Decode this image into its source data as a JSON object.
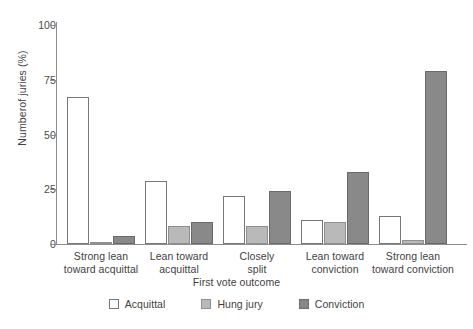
{
  "chart_data": {
    "type": "bar",
    "title": "",
    "subtitle": "",
    "xlabel": "First vote outcome",
    "ylabel": "Numberof juries (%)",
    "categories": [
      "Strong lean toward acquittal",
      "Lean toward acquittal",
      "Closely split",
      "Lean toward conviction",
      "Strong lean toward conviction"
    ],
    "category_lines": [
      [
        "Strong lean",
        "toward acquittal"
      ],
      [
        "Lean toward",
        "acquittal"
      ],
      [
        "Closely",
        "split"
      ],
      [
        "Lean toward",
        "conviction"
      ],
      [
        "Strong lean",
        "toward conviction"
      ]
    ],
    "series": [
      {
        "name": "Acquittal",
        "color": "#ffffff",
        "values": [
          67,
          29,
          22,
          11,
          13
        ]
      },
      {
        "name": "Hung jury",
        "color": "#b9b9b9",
        "values": [
          1,
          8,
          8,
          10,
          2
        ]
      },
      {
        "name": "Conviction",
        "color": "#898989",
        "values": [
          3.5,
          10,
          24,
          33,
          79
        ]
      }
    ],
    "ylim": [
      0,
      100
    ],
    "yticks": [
      0,
      25,
      50,
      75,
      100
    ],
    "ytick_labels": [
      "0",
      "25",
      "50",
      "75",
      "100"
    ],
    "grid": false,
    "legend_position": "bottom",
    "axis_color": "#8d8d8d"
  },
  "legend": {
    "items": [
      {
        "label": "Acquittal",
        "swatch": "acquittal"
      },
      {
        "label": "Hung jury",
        "swatch": "hung"
      },
      {
        "label": "Conviction",
        "swatch": "conviction"
      }
    ]
  }
}
